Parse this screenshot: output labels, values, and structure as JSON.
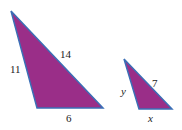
{
  "diagram": {
    "fill_color": "#9a2e88",
    "edge_color": "#3b6fb6",
    "triangles": [
      {
        "name": "large",
        "labels": {
          "left": "11",
          "hyp": "14",
          "base": "6"
        }
      },
      {
        "name": "small",
        "labels": {
          "left": "y",
          "hyp": "7",
          "base": "x"
        }
      }
    ]
  }
}
